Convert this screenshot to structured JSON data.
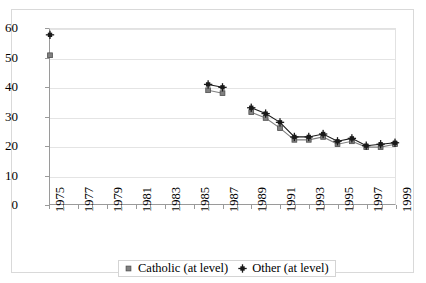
{
  "chart_data": {
    "type": "line",
    "title": "",
    "subtitle": "",
    "xlabel": "",
    "ylabel": "",
    "xlim": [
      1975,
      1999
    ],
    "ylim": [
      0,
      60
    ],
    "y_ticks": [
      0,
      10,
      20,
      30,
      40,
      50,
      60
    ],
    "x_ticks": [
      1975,
      1976,
      1977,
      1978,
      1979,
      1980,
      1981,
      1982,
      1983,
      1984,
      1985,
      1986,
      1987,
      1988,
      1989,
      1990,
      1991,
      1992,
      1993,
      1994,
      1995,
      1996,
      1997,
      1998,
      1999
    ],
    "x_tick_labels": [
      "1975",
      "",
      "1977",
      "",
      "1979",
      "",
      "1981",
      "",
      "1983",
      "",
      "1985",
      "",
      "1987",
      "",
      "1989",
      "",
      "1991",
      "",
      "1993",
      "",
      "1995",
      "",
      "1997",
      "",
      "1999"
    ],
    "grid": "horizontal",
    "legend_position": "bottom-center",
    "series": [
      {
        "name": "Catholic (at level)",
        "marker": "square",
        "color": "#808080",
        "points": [
          {
            "x": 1975,
            "y": 51
          },
          {
            "x": 1986,
            "y": 39
          },
          {
            "x": 1987,
            "y": 38
          },
          {
            "x": 1989,
            "y": 31.5
          },
          {
            "x": 1990,
            "y": 29.5
          },
          {
            "x": 1991,
            "y": 26
          },
          {
            "x": 1992,
            "y": 22
          },
          {
            "x": 1993,
            "y": 22
          },
          {
            "x": 1994,
            "y": 23
          },
          {
            "x": 1995,
            "y": 20.5
          },
          {
            "x": 1996,
            "y": 21.5
          },
          {
            "x": 1997,
            "y": 19.5
          },
          {
            "x": 1998,
            "y": 19.5
          },
          {
            "x": 1999,
            "y": 20.5
          }
        ],
        "segments": [
          [
            1975
          ],
          [
            1986,
            1987
          ],
          [
            1989,
            1990,
            1991,
            1992,
            1993,
            1994,
            1995,
            1996,
            1997,
            1998,
            1999
          ]
        ]
      },
      {
        "name": "Other (at level)",
        "marker": "cross",
        "color": "#1a1a1a",
        "points": [
          {
            "x": 1975,
            "y": 58
          },
          {
            "x": 1986,
            "y": 41
          },
          {
            "x": 1987,
            "y": 40
          },
          {
            "x": 1989,
            "y": 33
          },
          {
            "x": 1990,
            "y": 31
          },
          {
            "x": 1991,
            "y": 28
          },
          {
            "x": 1992,
            "y": 23
          },
          {
            "x": 1993,
            "y": 23
          },
          {
            "x": 1994,
            "y": 24
          },
          {
            "x": 1995,
            "y": 21.5
          },
          {
            "x": 1996,
            "y": 22.5
          },
          {
            "x": 1997,
            "y": 20
          },
          {
            "x": 1998,
            "y": 20.5
          },
          {
            "x": 1999,
            "y": 21
          }
        ],
        "segments": [
          [
            1975
          ],
          [
            1986,
            1987
          ],
          [
            1989,
            1990,
            1991,
            1992,
            1993,
            1994,
            1995,
            1996,
            1997,
            1998,
            1999
          ]
        ]
      }
    ]
  },
  "legend": {
    "entries": [
      {
        "label": "Catholic (at level)"
      },
      {
        "label": "Other (at level)"
      }
    ]
  }
}
